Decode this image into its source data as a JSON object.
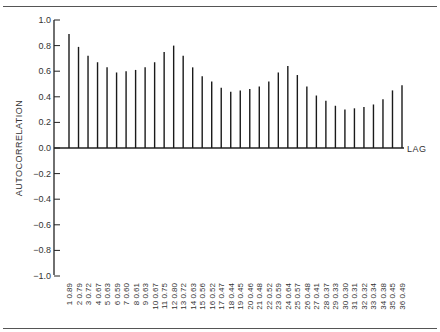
{
  "chart_data": {
    "type": "bar",
    "subtype": "autocorrelation-stem",
    "title": "",
    "xlabel": "LAG",
    "ylabel": "AUTOCORRELATION",
    "ylim": [
      -1.0,
      1.0
    ],
    "yticks": [
      "1.0",
      "0.8",
      "0.6",
      "0.4",
      "0.2",
      "0.0",
      "−0.2",
      "−0.4",
      "−0.6",
      "−0.8",
      "−1.0"
    ],
    "grid": false,
    "legend": null,
    "categories": [
      1,
      2,
      3,
      4,
      5,
      6,
      7,
      8,
      9,
      10,
      11,
      12,
      13,
      14,
      15,
      16,
      17,
      18,
      19,
      20,
      21,
      22,
      23,
      24,
      25,
      26,
      27,
      28,
      29,
      30,
      31,
      32,
      33,
      34,
      35,
      36
    ],
    "values": [
      0.89,
      0.79,
      0.72,
      0.67,
      0.63,
      0.59,
      0.6,
      0.61,
      0.63,
      0.67,
      0.75,
      0.8,
      0.72,
      0.63,
      0.56,
      0.52,
      0.47,
      0.44,
      0.45,
      0.46,
      0.48,
      0.52,
      0.59,
      0.64,
      0.57,
      0.48,
      0.41,
      0.37,
      0.33,
      0.3,
      0.31,
      0.32,
      0.34,
      0.38,
      0.45,
      0.49
    ],
    "value_labels": [
      "0.89",
      "0.79",
      "0.72",
      "0.67",
      "0.63",
      "0.59",
      "0.60",
      "0.61",
      "0.63",
      "0.67",
      "0.75",
      "0.80",
      "0.72",
      "0.63",
      "0.56",
      "0.52",
      "0.47",
      "0.44",
      "0.45",
      "0.46",
      "0.48",
      "0.52",
      "0.59",
      "0.64",
      "0.57",
      "0.48",
      "0.41",
      "0.37",
      "0.33",
      "0.30",
      "0.31",
      "0.32",
      "0.34",
      "0.38",
      "0.45",
      "0.49"
    ]
  },
  "colors": {
    "bar": "#1a1a1a",
    "axis": "#222222",
    "rule": "#555555",
    "text": "#333333"
  }
}
